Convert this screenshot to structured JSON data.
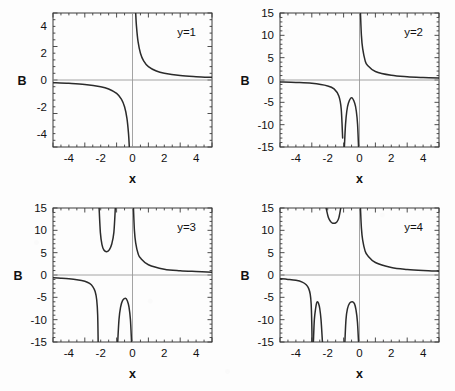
{
  "figure": {
    "background_color": "#fdfdfd",
    "curve_color": "#2b2b2b",
    "frame_color": "#3a3a3a",
    "axis_color": "#9a9a9a",
    "rows": 2,
    "cols": 2
  },
  "chart_data": [
    {
      "type": "line",
      "title": "",
      "annotation": "y=1",
      "xlabel": "x",
      "ylabel": "B",
      "xlim": [
        -5,
        5
      ],
      "ylim": [
        -5,
        5
      ],
      "xticks": [
        -4,
        -2,
        0,
        2,
        4
      ],
      "xtick_labels": [
        "-4",
        "-2",
        "0",
        "2",
        "4"
      ],
      "yticks": [
        -4,
        -2,
        0,
        2,
        4
      ],
      "ytick_labels": [
        "-4",
        "-2",
        "0",
        "2",
        "4"
      ],
      "grid": false,
      "legend": "none",
      "poles": [
        0
      ],
      "series": [
        {
          "name": "B(x) for y=1",
          "form": "1/x",
          "points_negative_branch": [
            [
              -5.0,
              -0.2
            ],
            [
              -4.0,
              -0.25
            ],
            [
              -3.0,
              -0.33
            ],
            [
              -2.0,
              -0.5
            ],
            [
              -1.5,
              -0.67
            ],
            [
              -1.0,
              -1.0
            ],
            [
              -0.7,
              -1.43
            ],
            [
              -0.5,
              -2.0
            ],
            [
              -0.35,
              -2.86
            ],
            [
              -0.25,
              -4.0
            ],
            [
              -0.2,
              -5.0
            ]
          ],
          "points_positive_branch": [
            [
              0.2,
              5.0
            ],
            [
              0.25,
              4.0
            ],
            [
              0.35,
              2.86
            ],
            [
              0.5,
              2.0
            ],
            [
              0.7,
              1.43
            ],
            [
              1.0,
              1.0
            ],
            [
              1.5,
              0.67
            ],
            [
              2.0,
              0.5
            ],
            [
              3.0,
              0.33
            ],
            [
              4.0,
              0.25
            ],
            [
              5.0,
              0.2
            ]
          ]
        }
      ]
    },
    {
      "type": "line",
      "title": "",
      "annotation": "y=2",
      "xlabel": "x",
      "ylabel": "B",
      "xlim": [
        -5,
        5
      ],
      "ylim": [
        -15,
        15
      ],
      "xticks": [
        -4,
        -2,
        0,
        2,
        4
      ],
      "xtick_labels": [
        "-4",
        "-2",
        "0",
        "2",
        "4"
      ],
      "yticks": [
        -15,
        -10,
        -5,
        0,
        5,
        10,
        15
      ],
      "ytick_labels": [
        "-15",
        "-10",
        "-5",
        "0",
        "5",
        "10",
        "15"
      ],
      "grid": false,
      "legend": "none",
      "poles": [
        -1.0,
        0.0
      ],
      "local_extrema": [
        {
          "x": -0.5,
          "B": -4.0,
          "kind": "maximum of lower lobe"
        }
      ],
      "series": [
        {
          "name": "B(x) for y=2",
          "points_left_tail": [
            [
              -5.0,
              -0.42
            ],
            [
              -4.0,
              -0.54
            ],
            [
              -3.0,
              -0.75
            ],
            [
              -2.0,
              -1.33
            ],
            [
              -1.6,
              -2.0
            ],
            [
              -1.3,
              -3.6
            ],
            [
              -1.15,
              -6.5
            ],
            [
              -1.06,
              -13.0
            ]
          ],
          "points_lower_lobe": [
            [
              -0.95,
              -15.0
            ],
            [
              -0.88,
              -10.0
            ],
            [
              -0.8,
              -7.0
            ],
            [
              -0.7,
              -5.2
            ],
            [
              -0.5,
              -4.0
            ],
            [
              -0.3,
              -5.2
            ],
            [
              -0.2,
              -7.0
            ],
            [
              -0.12,
              -10.0
            ],
            [
              -0.06,
              -15.0
            ]
          ],
          "points_right_tail": [
            [
              0.06,
              15.0
            ],
            [
              0.12,
              10.0
            ],
            [
              0.2,
              7.0
            ],
            [
              0.35,
              4.4
            ],
            [
              0.5,
              3.3
            ],
            [
              1.0,
              1.9
            ],
            [
              2.0,
              1.05
            ],
            [
              3.0,
              0.72
            ],
            [
              4.0,
              0.55
            ],
            [
              5.0,
              0.44
            ]
          ]
        }
      ]
    },
    {
      "type": "line",
      "title": "",
      "annotation": "y=3",
      "xlabel": "x",
      "ylabel": "B",
      "xlim": [
        -5,
        5
      ],
      "ylim": [
        -15,
        15
      ],
      "xticks": [
        -4,
        -2,
        0,
        2,
        4
      ],
      "xtick_labels": [
        "-4",
        "-2",
        "0",
        "2",
        "4"
      ],
      "yticks": [
        -15,
        -10,
        -5,
        0,
        5,
        10,
        15
      ],
      "ytick_labels": [
        "-15",
        "-10",
        "-5",
        "0",
        "5",
        "10",
        "15"
      ],
      "grid": false,
      "legend": "none",
      "poles": [
        -2.15,
        -1.0,
        0.0
      ],
      "local_extrema": [
        {
          "x": -1.62,
          "B": 5.2,
          "kind": "minimum of upper lobe"
        },
        {
          "x": -0.45,
          "B": -5.2,
          "kind": "maximum of lower lobe"
        }
      ],
      "series": [
        {
          "name": "B(x) for y=3",
          "points_left_tail": [
            [
              -5.0,
              -0.62
            ],
            [
              -4.5,
              -0.72
            ],
            [
              -4.0,
              -0.85
            ],
            [
              -3.5,
              -1.05
            ],
            [
              -3.0,
              -1.4
            ],
            [
              -2.7,
              -1.9
            ],
            [
              -2.5,
              -2.6
            ],
            [
              -2.35,
              -3.7
            ],
            [
              -2.25,
              -5.6
            ],
            [
              -2.19,
              -9.0
            ],
            [
              -2.16,
              -15.0
            ]
          ],
          "points_upper_lobe": [
            [
              -2.1,
              15.0
            ],
            [
              -2.02,
              9.5
            ],
            [
              -1.92,
              6.8
            ],
            [
              -1.8,
              5.6
            ],
            [
              -1.62,
              5.2
            ],
            [
              -1.45,
              5.7
            ],
            [
              -1.3,
              7.0
            ],
            [
              -1.17,
              9.6
            ],
            [
              -1.08,
              15.0
            ]
          ],
          "points_lower_lobe": [
            [
              -0.93,
              -15.0
            ],
            [
              -0.85,
              -10.0
            ],
            [
              -0.75,
              -7.2
            ],
            [
              -0.62,
              -5.7
            ],
            [
              -0.45,
              -5.2
            ],
            [
              -0.32,
              -5.8
            ],
            [
              -0.22,
              -7.2
            ],
            [
              -0.13,
              -10.0
            ],
            [
              -0.06,
              -15.0
            ]
          ],
          "points_right_tail": [
            [
              0.06,
              15.0
            ],
            [
              0.12,
              10.0
            ],
            [
              0.2,
              7.2
            ],
            [
              0.35,
              4.8
            ],
            [
              0.5,
              3.8
            ],
            [
              1.0,
              2.3
            ],
            [
              2.0,
              1.3
            ],
            [
              3.0,
              0.95
            ],
            [
              4.0,
              0.78
            ],
            [
              5.0,
              0.64
            ]
          ]
        }
      ]
    },
    {
      "type": "line",
      "title": "",
      "annotation": "y=4",
      "xlabel": "x",
      "ylabel": "B",
      "xlim": [
        -5,
        5
      ],
      "ylim": [
        -15,
        15
      ],
      "xticks": [
        -4,
        -2,
        0,
        2,
        4
      ],
      "xtick_labels": [
        "-4",
        "-2",
        "0",
        "2",
        "4"
      ],
      "yticks": [
        -15,
        -10,
        -5,
        0,
        5,
        10,
        15
      ],
      "ytick_labels": [
        "-15",
        "-10",
        "-5",
        "0",
        "5",
        "10",
        "15"
      ],
      "grid": false,
      "legend": "none",
      "poles": [
        -3.0,
        -2.15,
        -1.0,
        0.0
      ],
      "local_extrema": [
        {
          "x": -2.65,
          "B": -6.0,
          "kind": "maximum of left lower lobe"
        },
        {
          "x": -1.55,
          "B": 11.6,
          "kind": "minimum of upper lobe"
        },
        {
          "x": -0.45,
          "B": -6.0,
          "kind": "maximum of right lower lobe"
        }
      ],
      "series": [
        {
          "name": "B(x) for y=4",
          "points_left_tail": [
            [
              -5.0,
              -0.82
            ],
            [
              -4.5,
              -0.98
            ],
            [
              -4.0,
              -1.2
            ],
            [
              -3.6,
              -1.6
            ],
            [
              -3.35,
              -2.2
            ],
            [
              -3.2,
              -3.0
            ],
            [
              -3.1,
              -4.3
            ],
            [
              -3.04,
              -6.5
            ],
            [
              -3.0,
              -11.0
            ],
            [
              -2.985,
              -15.0
            ]
          ],
          "points_left_lower_lobe": [
            [
              -2.9,
              -15.0
            ],
            [
              -2.84,
              -10.0
            ],
            [
              -2.76,
              -7.5
            ],
            [
              -2.7,
              -6.3
            ],
            [
              -2.65,
              -6.0
            ],
            [
              -2.58,
              -6.3
            ],
            [
              -2.5,
              -7.5
            ],
            [
              -2.42,
              -10.0
            ],
            [
              -2.33,
              -15.0
            ]
          ],
          "points_upper_lobe": [
            [
              -2.1,
              15.0
            ],
            [
              -1.95,
              12.8
            ],
            [
              -1.8,
              11.9
            ],
            [
              -1.68,
              11.6
            ],
            [
              -1.55,
              11.6
            ],
            [
              -1.42,
              11.9
            ],
            [
              -1.3,
              12.8
            ],
            [
              -1.18,
              15.0
            ]
          ],
          "points_right_lower_lobe": [
            [
              -0.92,
              -15.0
            ],
            [
              -0.85,
              -10.0
            ],
            [
              -0.76,
              -7.6
            ],
            [
              -0.62,
              -6.3
            ],
            [
              -0.45,
              -6.0
            ],
            [
              -0.32,
              -6.4
            ],
            [
              -0.22,
              -7.8
            ],
            [
              -0.13,
              -10.5
            ],
            [
              -0.06,
              -15.0
            ]
          ],
          "points_right_tail": [
            [
              0.06,
              15.0
            ],
            [
              0.12,
              10.5
            ],
            [
              0.2,
              7.8
            ],
            [
              0.35,
              5.4
            ],
            [
              0.5,
              4.4
            ],
            [
              1.0,
              2.8
            ],
            [
              2.0,
              1.7
            ],
            [
              3.0,
              1.25
            ],
            [
              4.0,
              1.0
            ],
            [
              5.0,
              0.85
            ]
          ]
        }
      ]
    }
  ],
  "panels": [
    {
      "id": "panel-1",
      "annotation": "y=1",
      "xlabel": "x",
      "ylabel": "B"
    },
    {
      "id": "panel-2",
      "annotation": "y=2",
      "xlabel": "x",
      "ylabel": "B"
    },
    {
      "id": "panel-3",
      "annotation": "y=3",
      "xlabel": "x",
      "ylabel": "B"
    },
    {
      "id": "panel-4",
      "annotation": "y=4",
      "xlabel": "x",
      "ylabel": "B"
    }
  ]
}
